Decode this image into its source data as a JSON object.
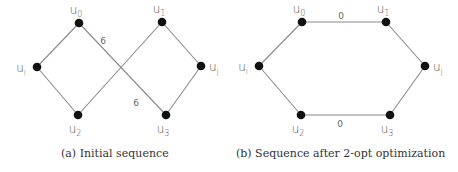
{
  "figures": [
    {
      "id": "a",
      "caption": "(a) Initial sequence",
      "nodes": [
        {
          "id": "u0",
          "base": "u",
          "sub": "0",
          "x": 79,
          "y": 23
        },
        {
          "id": "u1",
          "base": "u",
          "sub": "1",
          "x": 162,
          "y": 22
        },
        {
          "id": "ui",
          "base": "u",
          "sub": "i",
          "x": 37,
          "y": 67
        },
        {
          "id": "uj",
          "base": "u",
          "sub": "j",
          "x": 201,
          "y": 66
        },
        {
          "id": "u2",
          "base": "u",
          "sub": "2",
          "x": 78,
          "y": 115
        },
        {
          "id": "u3",
          "base": "u",
          "sub": "3",
          "x": 166,
          "y": 115
        }
      ],
      "edges": [
        {
          "from": "ui",
          "to": "u0"
        },
        {
          "from": "u0",
          "to": "u3",
          "label": "6"
        },
        {
          "from": "u3",
          "to": "uj"
        },
        {
          "from": "uj",
          "to": "u1"
        },
        {
          "from": "u1",
          "to": "u2",
          "label": "6"
        },
        {
          "from": "u2",
          "to": "ui"
        }
      ],
      "edge_labels": [
        {
          "text": "6",
          "x": 103,
          "y": 44
        },
        {
          "text": "6",
          "x": 136,
          "y": 106
        }
      ]
    },
    {
      "id": "b",
      "caption": "(b) Sequence after 2-opt optimization",
      "nodes": [
        {
          "id": "u0",
          "base": "u",
          "sub": "0",
          "x": 302,
          "y": 22
        },
        {
          "id": "u1",
          "base": "u",
          "sub": "1",
          "x": 386,
          "y": 22
        },
        {
          "id": "ui",
          "base": "u",
          "sub": "i",
          "x": 259,
          "y": 66
        },
        {
          "id": "uj",
          "base": "u",
          "sub": "j",
          "x": 425,
          "y": 66
        },
        {
          "id": "u2",
          "base": "u",
          "sub": "2",
          "x": 301,
          "y": 115
        },
        {
          "id": "u3",
          "base": "u",
          "sub": "3",
          "x": 390,
          "y": 115
        }
      ],
      "edges": [
        {
          "from": "ui",
          "to": "u0"
        },
        {
          "from": "u0",
          "to": "u1",
          "label": "0"
        },
        {
          "from": "u1",
          "to": "uj"
        },
        {
          "from": "uj",
          "to": "u3"
        },
        {
          "from": "u3",
          "to": "u2",
          "label": "0"
        },
        {
          "from": "u2",
          "to": "ui"
        }
      ],
      "edge_labels": [
        {
          "text": "0",
          "x": 341,
          "y": 19
        },
        {
          "text": "0",
          "x": 340,
          "y": 127
        }
      ]
    }
  ]
}
